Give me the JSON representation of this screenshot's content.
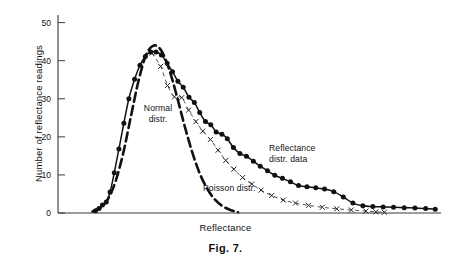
{
  "figure": {
    "caption": "Fig. 7."
  },
  "chart_data": {
    "type": "scatter",
    "title": "",
    "xlabel": "Reflectance",
    "ylabel": "Number of reflectance readings",
    "xlim": [
      0,
      100
    ],
    "ylim": [
      0,
      52
    ],
    "grid": false,
    "legend_position": "inline-annotations",
    "y_ticks": [
      0,
      10,
      20,
      30,
      40,
      50
    ],
    "y_tick_labels": [
      "0",
      "10",
      "20",
      "30",
      "40",
      "50"
    ],
    "x_ticks": [],
    "x_tick_labels": [],
    "annotations": [
      {
        "name": "normal-distr",
        "text": "Normal\ndistr.",
        "x": 33,
        "y": 28
      },
      {
        "name": "poisson-distr",
        "text": "Poisson distr.",
        "x": 52,
        "y": 7
      },
      {
        "name": "reflectance-distr-data",
        "text": "Reflectance\ndistr. data",
        "x": 72,
        "y": 18
      }
    ],
    "series": [
      {
        "name": "Reflectance distr. data",
        "marker": "filled-circle",
        "style": "points-with-solid-fit-curve",
        "x": [
          9.8,
          10.7,
          11.6,
          12.6,
          13.6,
          14.7,
          15.9,
          17.2,
          18.5,
          20.0,
          21.4,
          22.8,
          24.2,
          25.6,
          27.0,
          28.5,
          29.9,
          31.3,
          32.7,
          34.2,
          35.6,
          37.0,
          38.5,
          39.9,
          41.3,
          42.8,
          44.2,
          45.8,
          47.5,
          49.2,
          51.0,
          52.8,
          54.7,
          56.6,
          58.6,
          60.7,
          62.8,
          65.0,
          67.3,
          69.6,
          72.0,
          74.5,
          77.0,
          79.6,
          82.2,
          84.9,
          87.6,
          90.4,
          93.2,
          96.0,
          98.5
        ],
        "y": [
          0.6,
          1.2,
          2.1,
          2.9,
          5.5,
          10.6,
          16.8,
          23.6,
          30.0,
          35.1,
          38.8,
          41.1,
          42.3,
          42.3,
          41.5,
          39.3,
          37.1,
          34.6,
          33.0,
          30.4,
          29.0,
          26.4,
          24.0,
          23.2,
          21.3,
          20.7,
          19.5,
          17.2,
          15.6,
          14.9,
          13.6,
          12.3,
          11.1,
          9.9,
          9.1,
          8.2,
          7.2,
          6.9,
          6.6,
          6.3,
          5.6,
          4.2,
          2.6,
          1.9,
          1.7,
          1.6,
          1.5,
          1.4,
          1.3,
          1.2,
          1.0
        ]
      },
      {
        "name": "Normal distr.",
        "marker": "none",
        "style": "bold-dashed-curve",
        "x": [
          9.0,
          11.0,
          13.0,
          15.0,
          17.0,
          19.0,
          21.0,
          23.0,
          25.0,
          27.0,
          29.0,
          31.0,
          33.0,
          35.0,
          37.0,
          39.0,
          41.0,
          43.0,
          45.0,
          47.0
        ],
        "y": [
          0.4,
          1.3,
          3.6,
          8.2,
          15.6,
          25.2,
          34.6,
          41.5,
          44.0,
          42.6,
          37.8,
          30.8,
          23.1,
          16.1,
          10.4,
          6.3,
          3.5,
          1.8,
          0.8,
          0.2
        ]
      },
      {
        "name": "Poisson distr.",
        "marker": "x",
        "style": "thin-dashed-curve-with-x-markers",
        "x": [
          24.5,
          26.8,
          28.6,
          30.4,
          32.3,
          34.1,
          36.0,
          37.8,
          39.8,
          41.8,
          43.8,
          45.9,
          48.2,
          50.6,
          53.0,
          55.8,
          58.8,
          62.0,
          65.4,
          69.0,
          72.8,
          76.6,
          80.4,
          83.0,
          85.2
        ],
        "y": [
          42.0,
          38.5,
          33.5,
          30.5,
          30.3,
          27.0,
          24.0,
          21.5,
          19.3,
          16.5,
          13.8,
          11.5,
          9.3,
          7.6,
          6.0,
          4.6,
          3.4,
          2.6,
          2.0,
          1.5,
          1.1,
          0.8,
          0.5,
          0.3,
          0.2
        ]
      }
    ]
  }
}
